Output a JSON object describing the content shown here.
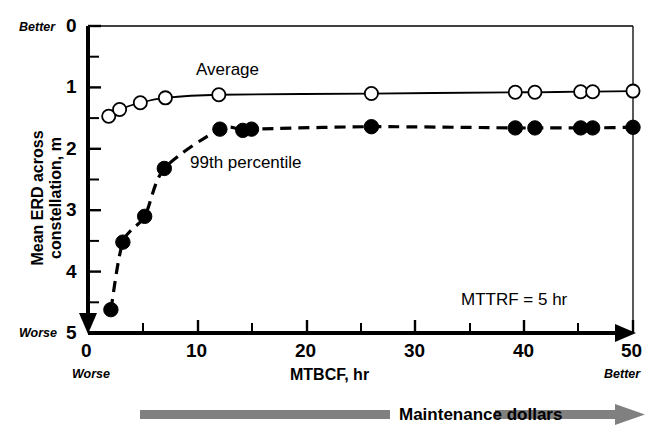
{
  "chart_data": {
    "type": "line",
    "title": "",
    "xlabel": "MTBCF, hr",
    "ylabel": "Mean ERD across constellation, m",
    "xlim": [
      0,
      50
    ],
    "ylim": [
      0,
      5
    ],
    "y_inverted": true,
    "grid": false,
    "xticks": [
      0,
      10,
      20,
      30,
      40,
      50
    ],
    "xtick_labels": [
      "0",
      "10",
      "20",
      "30",
      "40",
      "50"
    ],
    "xminor_ticks": [
      5,
      15,
      25,
      35,
      45
    ],
    "yticks": [
      0,
      1,
      2,
      3,
      4,
      5
    ],
    "ytick_labels": [
      "0",
      "1",
      "2",
      "3",
      "4",
      "5"
    ],
    "yminor_ticks": [
      0.5,
      1.5,
      2.5,
      3.5,
      4.5
    ],
    "legend_position": "inline-annotation",
    "annotations": [
      {
        "text": "MTTRF = 5 hr",
        "x": 34.5,
        "y": 4.3
      },
      {
        "text": "Better",
        "x": -2.5,
        "y": 0,
        "style": "italic",
        "role": "y-axis-top-direction"
      },
      {
        "text": "Worse",
        "x": -2.5,
        "y": 5,
        "style": "italic",
        "role": "y-axis-bottom-direction"
      },
      {
        "text": "Worse",
        "x": 0,
        "y": -0.95,
        "style": "italic",
        "role": "x-axis-left-direction"
      },
      {
        "text": "Better",
        "x": 50,
        "y": -0.95,
        "style": "italic",
        "role": "x-axis-right-direction"
      }
    ],
    "series": [
      {
        "name": "Average",
        "marker": "open-circle",
        "linestyle": "solid",
        "color": "#000000",
        "label_x": 19.5,
        "label_y": 0.62,
        "points": [
          {
            "x": 1.9,
            "y": 1.47
          },
          {
            "x": 2.9,
            "y": 1.36
          },
          {
            "x": 4.8,
            "y": 1.25
          },
          {
            "x": 7.1,
            "y": 1.17
          },
          {
            "x": 12.0,
            "y": 1.12
          },
          {
            "x": 26.0,
            "y": 1.1
          },
          {
            "x": 39.2,
            "y": 1.08
          },
          {
            "x": 41.0,
            "y": 1.08
          },
          {
            "x": 45.2,
            "y": 1.07
          },
          {
            "x": 46.3,
            "y": 1.07
          },
          {
            "x": 50.0,
            "y": 1.06
          }
        ]
      },
      {
        "name": "99th percentile",
        "marker": "filled-circle",
        "linestyle": "dashed",
        "color": "#000000",
        "label_x": 10.5,
        "label_y": 2.32,
        "points": [
          {
            "x": 2.1,
            "y": 4.62
          },
          {
            "x": 3.2,
            "y": 3.52
          },
          {
            "x": 5.2,
            "y": 3.1
          },
          {
            "x": 7.0,
            "y": 2.32
          },
          {
            "x": 12.1,
            "y": 1.68
          },
          {
            "x": 14.2,
            "y": 1.7
          },
          {
            "x": 15.0,
            "y": 1.68
          },
          {
            "x": 26.0,
            "y": 1.64
          },
          {
            "x": 39.2,
            "y": 1.66
          },
          {
            "x": 41.0,
            "y": 1.66
          },
          {
            "x": 45.2,
            "y": 1.66
          },
          {
            "x": 46.3,
            "y": 1.66
          },
          {
            "x": 50.0,
            "y": 1.65
          }
        ]
      }
    ]
  },
  "axes": {
    "y_title": "Mean ERD across constellation, m",
    "x_title": "MTBCF, hr",
    "y_better": "Better",
    "y_worse": "Worse",
    "x_worse": "Worse",
    "x_better": "Better",
    "ytick_0": "0",
    "ytick_1": "1",
    "ytick_2": "2",
    "ytick_3": "3",
    "ytick_4": "4",
    "ytick_5": "5",
    "xtick_0": "0",
    "xtick_10": "10",
    "xtick_20": "20",
    "xtick_30": "30",
    "xtick_40": "40",
    "xtick_50": "50"
  },
  "series_labels": {
    "average": "Average",
    "percentile": "99th percentile"
  },
  "annotation": {
    "mttrf": "MTTRF = 5 hr"
  },
  "footer": {
    "maintenance": "Maintenance dollars",
    "arrow_color": "#808080"
  }
}
